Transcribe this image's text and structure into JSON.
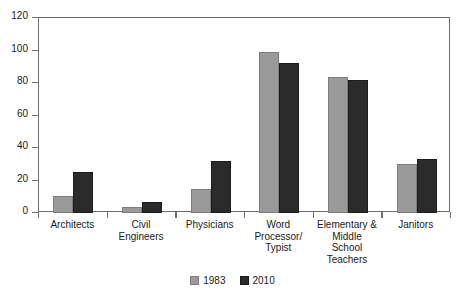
{
  "chart_data": {
    "type": "bar",
    "title": "",
    "subtitle": "",
    "xlabel": "",
    "ylabel": "",
    "ylim": [
      0,
      120
    ],
    "ytick_values": [
      0,
      20,
      40,
      60,
      80,
      100,
      120
    ],
    "ytick_labels": [
      "0",
      "20",
      "40",
      "60",
      "80",
      "100",
      "120"
    ],
    "grid": false,
    "legend_position": "bottom-center",
    "categories": [
      "Architects",
      "Civil Engineers",
      "Physicians",
      "Word Processor/ Typist",
      "Elementary & Middle School Teachers",
      "Janitors"
    ],
    "category_label_lines": [
      [
        "Architects"
      ],
      [
        "Civil",
        "Engineers"
      ],
      [
        "Physicians"
      ],
      [
        "Word",
        "Processor/",
        "Typist"
      ],
      [
        "Elementary &",
        "Middle",
        "School",
        "Teachers"
      ],
      [
        "Janitors"
      ]
    ],
    "series": [
      {
        "name": "1983",
        "color": "#9a9a9a",
        "values": [
          10.5,
          4,
          15,
          99,
          84,
          30
        ]
      },
      {
        "name": "2010",
        "color": "#2b2b2b",
        "values": [
          25.5,
          7,
          32,
          92.5,
          82,
          33
        ]
      }
    ]
  },
  "legend": {
    "items": [
      {
        "label": "1983",
        "swatch": "swatch-1983"
      },
      {
        "label": "2010",
        "swatch": "swatch-2010"
      }
    ]
  }
}
